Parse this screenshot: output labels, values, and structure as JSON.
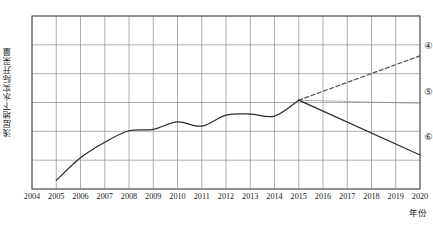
{
  "chart_data": {
    "type": "line",
    "title": "",
    "xlabel": "年份",
    "ylabel": "浅层地下水实际开采量",
    "x_tick_labels": [
      "2004",
      "2005",
      "2006",
      "2007",
      "2008",
      "2009",
      "2010",
      "2011",
      "2012",
      "2013",
      "2014",
      "2015",
      "2016",
      "2017",
      "2018",
      "2019",
      "2020"
    ],
    "xlim": [
      2004,
      2020
    ],
    "ylim": [
      0,
      6
    ],
    "y_tick_labels": [],
    "grid": true,
    "legend_position": "right-inside",
    "series": [
      {
        "name": "④",
        "label": "④",
        "style": "dashed",
        "color": "#555555",
        "x": [
          2015,
          2020
        ],
        "values": [
          3.08,
          4.62
        ]
      },
      {
        "name": "⑤",
        "label": "⑤",
        "style": "dotted",
        "color": "#7a7a7a",
        "x": [
          2015,
          2020
        ],
        "values": [
          3.08,
          2.97
        ]
      },
      {
        "name": "⑥",
        "label": "⑥",
        "style": "solid",
        "color": "#2b2b2b",
        "x": [
          2015,
          2020
        ],
        "values": [
          3.08,
          1.18
        ]
      },
      {
        "name": "历史实测",
        "label": "",
        "style": "solid",
        "color": "#2b2b2b",
        "x": [
          2005,
          2006,
          2007,
          2008,
          2009,
          2010,
          2011,
          2012,
          2013,
          2014,
          2015
        ],
        "values": [
          0.3,
          1.08,
          1.62,
          2.02,
          2.07,
          2.33,
          2.18,
          2.56,
          2.6,
          2.53,
          3.08
        ]
      }
    ],
    "annotations": [
      {
        "label": "④",
        "x": 2020.35,
        "y": 4.95
      },
      {
        "label": "⑤",
        "x": 2020.35,
        "y": 3.38
      },
      {
        "label": "⑥",
        "x": 2020.35,
        "y": 1.8
      }
    ]
  }
}
